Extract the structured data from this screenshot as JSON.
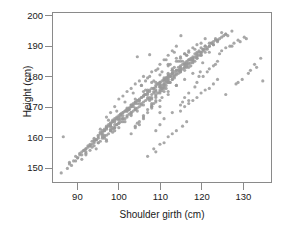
{
  "chart_data": {
    "type": "scatter",
    "title": "",
    "xlabel": "Shoulder girth (cm)",
    "ylabel": "Height (cm)",
    "xlim": [
      84,
      137
    ],
    "ylim": [
      145,
      201
    ],
    "xticks": [
      90,
      100,
      110,
      120,
      130
    ],
    "yticks": [
      150,
      160,
      170,
      180,
      190,
      200
    ],
    "grid": false,
    "legend": null,
    "marker": {
      "shape": "circle",
      "color": "#999999",
      "size_px": 3.2,
      "opacity": 0.85
    },
    "n_points": 507,
    "x": [
      106.2,
      110.5,
      115.1,
      104.5,
      107.5,
      119.8,
      123.5,
      120.4,
      111.0,
      119.5,
      110.0,
      112.4,
      112.0,
      110.0,
      111.5,
      112.0,
      109.0,
      108.0,
      104.0,
      106.0,
      116.5,
      112.0,
      116.0,
      115.5,
      115.0,
      111.5,
      112.0,
      113.0,
      110.0,
      114.0,
      108.0,
      110.5,
      110.0,
      107.0,
      109.0,
      110.0,
      111.0,
      110.5,
      106.0,
      105.0,
      112.0,
      107.0,
      109.0,
      108.0,
      108.5,
      109.0,
      113.0,
      111.0,
      110.0,
      108.0,
      104.0,
      103.0,
      105.0,
      110.0,
      112.0,
      108.0,
      106.0,
      104.5,
      109.0,
      111.0,
      113.5,
      115.0,
      117.0,
      116.0,
      114.0,
      112.0,
      110.0,
      108.0,
      113.0,
      112.5,
      119.0,
      121.0,
      118.0,
      117.5,
      120.0,
      122.0,
      124.0,
      120.5,
      118.0,
      116.0,
      121.0,
      123.0,
      125.0,
      119.0,
      117.0,
      120.0,
      122.5,
      126.0,
      124.5,
      118.5,
      115.0,
      113.0,
      111.0,
      114.5,
      116.5,
      118.0,
      120.0,
      117.0,
      115.5,
      113.5,
      96.0,
      94.0,
      92.5,
      95.0,
      97.0,
      99.0,
      98.0,
      96.5,
      93.0,
      91.0,
      100.0,
      102.0,
      98.5,
      97.5,
      101.0,
      103.0,
      99.5,
      96.0,
      94.5,
      100.5,
      104.0,
      102.5,
      100.0,
      98.0,
      96.0,
      101.5,
      103.5,
      105.0,
      99.0,
      97.0,
      95.0,
      93.5,
      92.0,
      94.0,
      96.5,
      98.5,
      100.5,
      102.0,
      97.0,
      95.5,
      90.0,
      88.5,
      91.5,
      93.0,
      89.5,
      92.0,
      94.5,
      90.5,
      88.0,
      86.5,
      99.0,
      101.0,
      103.0,
      105.5,
      107.0,
      104.0,
      102.0,
      100.0,
      98.0,
      106.5,
      108.5,
      110.0,
      107.5,
      105.0,
      103.5,
      109.5,
      111.5,
      106.0,
      104.5,
      102.5,
      113.0,
      115.0,
      117.0,
      112.5,
      110.5,
      114.0,
      116.0,
      118.5,
      111.5,
      109.0,
      119.0,
      121.5,
      123.0,
      120.0,
      117.5,
      122.0,
      124.0,
      126.5,
      118.0,
      116.5,
      127.0,
      129.0,
      125.0,
      128.0,
      130.5,
      126.0,
      124.5,
      131.0,
      129.5,
      127.5,
      133.0,
      134.5,
      132.0,
      130.0,
      128.5,
      131.5,
      133.5,
      129.0,
      126.0,
      135.0,
      95.0,
      97.5,
      93.0,
      99.0,
      96.0,
      91.0,
      94.0,
      98.0,
      92.0,
      100.0,
      101.0,
      99.5,
      97.0,
      95.5,
      103.0,
      102.0,
      100.5,
      98.5,
      96.5,
      104.5,
      106.0,
      104.0,
      102.0,
      100.0,
      107.5,
      105.5,
      103.5,
      101.5,
      99.0,
      108.0,
      110.0,
      108.5,
      106.5,
      104.0,
      111.0,
      109.0,
      107.0,
      105.0,
      103.0,
      112.0,
      114.0,
      112.5,
      110.5,
      108.0,
      115.0,
      113.0,
      111.0,
      109.5,
      107.5,
      116.0,
      118.0,
      116.5,
      114.5,
      112.0,
      119.0,
      117.0,
      115.0,
      113.5,
      111.5,
      120.0,
      89.0,
      87.5,
      90.5,
      92.5,
      88.0,
      91.0,
      93.5,
      86.0,
      89.5,
      94.0,
      95.5,
      97.0,
      92.0,
      90.0,
      96.0,
      98.0,
      94.5,
      91.5,
      93.0,
      99.5,
      100.5,
      98.5,
      96.5,
      94.0,
      102.5,
      101.0,
      99.0,
      97.5,
      95.0,
      103.5,
      105.0,
      103.0,
      101.5,
      99.5,
      106.5,
      104.5,
      102.0,
      100.5,
      98.0,
      107.0,
      109.0,
      107.5,
      105.5,
      103.0,
      110.5,
      108.5,
      106.0,
      104.0,
      102.0,
      111.0,
      113.0,
      111.5,
      109.5,
      107.0,
      114.5,
      112.5,
      110.0,
      108.0,
      106.0,
      115.5,
      117.5,
      116.0,
      114.0,
      111.0,
      118.5,
      116.5,
      113.5,
      112.0,
      110.0,
      119.5,
      121.0,
      119.0,
      117.0,
      115.0,
      122.5,
      120.5,
      118.0,
      116.0,
      114.0,
      123.5,
      125.5,
      123.0,
      121.5,
      119.5,
      126.0,
      124.0,
      122.0,
      120.0,
      117.5,
      127.5,
      96.0,
      98.0,
      100.0,
      102.0,
      104.0,
      106.0,
      108.0,
      110.0,
      112.0,
      114.0,
      97.0,
      99.0,
      101.0,
      103.0,
      105.0,
      107.0,
      109.0,
      111.0,
      113.0,
      115.0,
      95.5,
      97.5,
      99.5,
      101.5,
      103.5,
      105.5,
      107.5,
      109.5,
      111.5,
      113.5,
      94.5,
      96.5,
      98.5,
      100.5,
      102.5,
      104.5,
      106.5,
      108.5,
      110.5,
      112.5,
      116.0,
      118.0,
      120.0,
      115.0,
      117.0,
      119.0,
      121.0,
      114.5,
      116.5,
      118.5,
      92.0,
      93.5,
      95.0,
      96.5,
      98.0,
      99.5,
      101.0,
      102.5,
      104.0,
      105.5,
      107.0,
      108.5,
      110.0,
      111.5,
      113.0,
      114.5,
      116.0,
      117.5,
      119.0,
      120.5,
      122.0,
      123.5,
      125.0,
      121.0,
      119.5,
      118.0,
      116.5,
      115.0,
      113.5,
      112.0,
      110.5,
      109.0,
      107.5,
      106.0,
      104.5,
      103.0,
      101.5,
      100.0,
      98.5,
      97.0,
      111.0,
      113.0,
      115.0,
      117.0,
      112.0,
      114.0,
      116.0,
      118.0,
      110.0,
      109.0,
      119.0,
      120.5,
      122.0,
      118.5,
      117.0,
      121.5,
      123.0,
      116.0,
      115.5,
      124.0,
      100.0,
      102.0,
      104.0,
      99.0,
      101.0,
      103.0,
      105.0,
      98.0,
      97.0,
      106.0,
      108.0,
      110.0,
      107.0,
      109.0,
      111.0,
      112.0,
      113.0,
      106.5,
      105.5,
      114.0,
      118.0,
      120.0,
      116.0,
      122.0,
      119.0,
      117.0,
      121.0,
      123.0,
      115.0,
      124.0,
      112.0,
      110.0,
      108.5,
      114.0,
      113.0,
      111.0,
      109.0,
      115.5,
      116.5,
      107.0
    ],
    "y": [
      174.0,
      175.3,
      193.5,
      186.5,
      187.2,
      181.5,
      184.0,
      184.5,
      175.0,
      180.0,
      168.0,
      178.0,
      174.0,
      170.0,
      178.0,
      184.0,
      178.0,
      171.0,
      163.0,
      167.0,
      187.0,
      180.0,
      183.0,
      185.0,
      182.0,
      176.0,
      179.0,
      181.0,
      172.0,
      177.0,
      170.0,
      173.0,
      174.5,
      168.0,
      171.5,
      175.0,
      177.0,
      176.0,
      166.0,
      164.0,
      179.5,
      169.0,
      172.0,
      170.5,
      171.0,
      173.0,
      182.0,
      178.5,
      176.5,
      169.5,
      163.5,
      161.0,
      165.0,
      175.5,
      180.5,
      170.0,
      166.5,
      164.5,
      173.5,
      177.5,
      183.0,
      186.0,
      188.0,
      187.5,
      185.0,
      181.0,
      177.0,
      172.5,
      182.5,
      180.0,
      186.5,
      189.0,
      184.5,
      183.5,
      187.0,
      190.0,
      192.0,
      188.5,
      185.5,
      182.0,
      188.0,
      190.5,
      193.0,
      186.0,
      183.0,
      187.5,
      191.0,
      194.0,
      192.5,
      185.0,
      181.5,
      179.0,
      176.0,
      182.0,
      184.0,
      186.0,
      189.5,
      184.5,
      182.5,
      179.5,
      161.0,
      158.0,
      156.5,
      160.0,
      163.0,
      166.0,
      164.5,
      162.0,
      157.0,
      154.0,
      167.0,
      169.5,
      165.5,
      164.0,
      168.0,
      170.5,
      166.5,
      161.5,
      159.0,
      167.5,
      171.0,
      169.0,
      166.0,
      163.5,
      160.5,
      168.5,
      170.0,
      172.0,
      165.0,
      162.5,
      159.5,
      157.5,
      155.0,
      158.5,
      162.0,
      165.0,
      167.5,
      169.0,
      163.0,
      161.0,
      153.0,
      150.5,
      155.5,
      157.0,
      152.0,
      156.0,
      159.0,
      154.5,
      151.5,
      160.0,
      164.0,
      167.0,
      170.0,
      173.0,
      175.5,
      171.5,
      168.5,
      165.5,
      162.5,
      174.0,
      176.0,
      178.0,
      175.0,
      172.0,
      170.5,
      177.5,
      179.5,
      173.5,
      171.0,
      169.0,
      181.0,
      183.5,
      185.5,
      180.0,
      177.0,
      182.0,
      184.0,
      186.5,
      179.0,
      175.5,
      186.0,
      189.0,
      190.5,
      187.0,
      184.5,
      188.0,
      191.5,
      193.5,
      185.0,
      183.0,
      190.0,
      192.0,
      188.5,
      191.0,
      193.0,
      189.5,
      187.5,
      192.5,
      191.5,
      190.0,
      184.0,
      186.0,
      182.0,
      179.0,
      177.5,
      181.0,
      183.0,
      178.0,
      174.0,
      178.5,
      158.0,
      161.0,
      155.5,
      163.0,
      159.5,
      152.5,
      157.0,
      162.0,
      154.0,
      164.5,
      166.0,
      164.0,
      160.5,
      158.5,
      168.0,
      166.5,
      165.0,
      162.5,
      160.0,
      169.5,
      171.5,
      169.0,
      167.0,
      164.5,
      173.0,
      170.5,
      168.5,
      166.0,
      163.0,
      174.0,
      176.5,
      174.5,
      172.0,
      169.0,
      177.5,
      175.0,
      172.5,
      170.0,
      167.5,
      178.5,
      180.5,
      178.0,
      176.0,
      173.0,
      182.0,
      179.0,
      176.5,
      174.5,
      172.0,
      183.0,
      185.5,
      183.5,
      181.0,
      178.0,
      187.0,
      184.0,
      181.5,
      180.0,
      177.0,
      188.0,
      152.0,
      149.5,
      154.0,
      157.0,
      151.0,
      155.0,
      158.5,
      148.0,
      153.5,
      159.5,
      161.5,
      163.5,
      156.0,
      153.0,
      162.0,
      164.5,
      159.0,
      155.5,
      157.5,
      166.0,
      167.5,
      165.0,
      162.5,
      159.0,
      169.5,
      168.0,
      165.5,
      163.5,
      160.5,
      171.0,
      172.5,
      170.5,
      168.5,
      166.0,
      174.0,
      172.0,
      169.0,
      167.0,
      164.0,
      175.0,
      177.0,
      175.5,
      173.0,
      170.0,
      178.5,
      176.0,
      173.5,
      171.5,
      168.5,
      179.0,
      181.0,
      179.5,
      177.5,
      174.5,
      183.0,
      180.5,
      178.0,
      176.0,
      173.5,
      184.0,
      186.0,
      184.5,
      182.0,
      179.0,
      187.5,
      185.0,
      181.5,
      180.0,
      177.5,
      188.5,
      190.0,
      188.0,
      185.5,
      183.0,
      191.0,
      189.0,
      186.5,
      184.0,
      181.0,
      192.0,
      193.5,
      191.5,
      189.5,
      187.0,
      194.0,
      192.0,
      190.0,
      188.0,
      185.5,
      195.0,
      160.0,
      163.5,
      166.5,
      169.0,
      172.5,
      175.0,
      178.0,
      180.5,
      183.5,
      186.0,
      158.5,
      162.0,
      165.0,
      168.0,
      171.0,
      174.0,
      176.5,
      179.5,
      182.0,
      185.0,
      162.5,
      165.5,
      168.5,
      171.5,
      174.5,
      177.0,
      180.0,
      182.5,
      185.5,
      188.0,
      156.0,
      159.5,
      163.0,
      166.0,
      169.5,
      172.0,
      175.5,
      178.5,
      181.5,
      184.0,
      187.5,
      189.5,
      191.0,
      186.5,
      188.5,
      190.5,
      192.5,
      185.0,
      187.0,
      189.0,
      154.5,
      156.5,
      158.0,
      160.5,
      162.0,
      164.0,
      166.0,
      167.5,
      169.5,
      171.0,
      173.0,
      175.0,
      176.5,
      178.5,
      180.0,
      182.0,
      184.0,
      185.5,
      187.5,
      189.0,
      191.0,
      192.5,
      194.5,
      190.0,
      188.0,
      186.0,
      184.5,
      182.5,
      180.5,
      178.0,
      176.0,
      174.0,
      172.5,
      170.5,
      168.5,
      167.0,
      165.0,
      163.0,
      161.5,
      159.0,
      166.0,
      168.0,
      170.5,
      172.0,
      175.0,
      177.0,
      179.0,
      181.0,
      164.0,
      162.0,
      178.0,
      180.0,
      182.5,
      176.5,
      174.5,
      181.5,
      183.5,
      173.0,
      171.5,
      185.0,
      172.5,
      175.0,
      177.5,
      170.0,
      173.5,
      176.0,
      178.5,
      168.0,
      166.5,
      180.0,
      181.5,
      184.0,
      179.5,
      182.0,
      185.5,
      187.0,
      188.5,
      178.5,
      177.0,
      190.0,
      172.0,
      174.5,
      170.0,
      176.0,
      173.0,
      171.0,
      175.5,
      177.5,
      168.5,
      179.0,
      160.0,
      157.5,
      156.0,
      162.0,
      161.0,
      158.0,
      155.0,
      163.5,
      165.0,
      153.5
    ]
  }
}
